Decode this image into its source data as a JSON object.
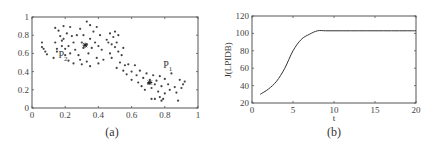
{
  "chart_data": [
    {
      "type": "scatter",
      "caption": "(a)",
      "title": "",
      "xlabel": "",
      "ylabel": "",
      "xlim": [
        0,
        1
      ],
      "ylim": [
        0,
        1
      ],
      "xticks": [
        "0",
        "0.2",
        "0.4",
        "0.6",
        "0.8",
        "1"
      ],
      "yticks": [
        "0",
        "0.2",
        "0.4",
        "0.6",
        "0.8",
        "1"
      ],
      "grid": false,
      "annotations": [
        {
          "text": "P2",
          "x": 0.16,
          "y": 0.55
        },
        {
          "text": "P1",
          "x": 0.79,
          "y": 0.44
        }
      ],
      "cluster_centers": [
        {
          "label": "P2",
          "x": 0.32,
          "y": 0.69
        },
        {
          "label": "P1",
          "x": 0.71,
          "y": 0.28
        }
      ],
      "points": [
        [
          0.06,
          0.72
        ],
        [
          0.06,
          0.67
        ],
        [
          0.07,
          0.65
        ],
        [
          0.08,
          0.62
        ],
        [
          0.09,
          0.59
        ],
        [
          0.13,
          0.55
        ],
        [
          0.14,
          0.88
        ],
        [
          0.14,
          0.72
        ],
        [
          0.15,
          0.65
        ],
        [
          0.15,
          0.62
        ],
        [
          0.16,
          0.85
        ],
        [
          0.17,
          0.79
        ],
        [
          0.18,
          0.74
        ],
        [
          0.18,
          0.68
        ],
        [
          0.19,
          0.9
        ],
        [
          0.19,
          0.76
        ],
        [
          0.2,
          0.65
        ],
        [
          0.2,
          0.58
        ],
        [
          0.21,
          0.82
        ],
        [
          0.22,
          0.68
        ],
        [
          0.22,
          0.52
        ],
        [
          0.23,
          0.89
        ],
        [
          0.23,
          0.6
        ],
        [
          0.24,
          0.79
        ],
        [
          0.25,
          0.72
        ],
        [
          0.25,
          0.49
        ],
        [
          0.26,
          0.64
        ],
        [
          0.27,
          0.8
        ],
        [
          0.28,
          0.58
        ],
        [
          0.29,
          0.87
        ],
        [
          0.29,
          0.53
        ],
        [
          0.3,
          0.72
        ],
        [
          0.3,
          0.48
        ],
        [
          0.31,
          0.66
        ],
        [
          0.31,
          0.8
        ],
        [
          0.32,
          0.69
        ],
        [
          0.33,
          0.95
        ],
        [
          0.33,
          0.7
        ],
        [
          0.33,
          0.51
        ],
        [
          0.34,
          0.6
        ],
        [
          0.35,
          0.91
        ],
        [
          0.35,
          0.76
        ],
        [
          0.35,
          0.46
        ],
        [
          0.36,
          0.66
        ],
        [
          0.37,
          0.84
        ],
        [
          0.38,
          0.72
        ],
        [
          0.39,
          0.89
        ],
        [
          0.39,
          0.55
        ],
        [
          0.4,
          0.68
        ],
        [
          0.4,
          0.49
        ],
        [
          0.41,
          0.8
        ],
        [
          0.42,
          0.64
        ],
        [
          0.43,
          0.53
        ],
        [
          0.45,
          0.75
        ],
        [
          0.46,
          0.72
        ],
        [
          0.47,
          0.82
        ],
        [
          0.47,
          0.6
        ],
        [
          0.48,
          0.7
        ],
        [
          0.48,
          0.55
        ],
        [
          0.49,
          0.78
        ],
        [
          0.5,
          0.67
        ],
        [
          0.5,
          0.84
        ],
        [
          0.51,
          0.44
        ],
        [
          0.51,
          0.72
        ],
        [
          0.52,
          0.62
        ],
        [
          0.52,
          0.8
        ],
        [
          0.53,
          0.5
        ],
        [
          0.54,
          0.58
        ],
        [
          0.55,
          0.41
        ],
        [
          0.55,
          0.66
        ],
        [
          0.56,
          0.47
        ],
        [
          0.57,
          0.37
        ],
        [
          0.58,
          0.48
        ],
        [
          0.6,
          0.4
        ],
        [
          0.6,
          0.31
        ],
        [
          0.62,
          0.47
        ],
        [
          0.63,
          0.36
        ],
        [
          0.64,
          0.28
        ],
        [
          0.65,
          0.41
        ],
        [
          0.66,
          0.24
        ],
        [
          0.67,
          0.33
        ],
        [
          0.68,
          0.2
        ],
        [
          0.69,
          0.38
        ],
        [
          0.7,
          0.27
        ],
        [
          0.71,
          0.28
        ],
        [
          0.71,
          0.31
        ],
        [
          0.72,
          0.22
        ],
        [
          0.72,
          0.1
        ],
        [
          0.73,
          0.36
        ],
        [
          0.74,
          0.26
        ],
        [
          0.74,
          0.1
        ],
        [
          0.75,
          0.3
        ],
        [
          0.76,
          0.18
        ],
        [
          0.77,
          0.35
        ],
        [
          0.77,
          0.12
        ],
        [
          0.78,
          0.24
        ],
        [
          0.78,
          0.08
        ],
        [
          0.79,
          0.1
        ],
        [
          0.8,
          0.16
        ],
        [
          0.8,
          0.32
        ],
        [
          0.82,
          0.26
        ],
        [
          0.83,
          0.2
        ],
        [
          0.84,
          0.38
        ],
        [
          0.86,
          0.23
        ],
        [
          0.87,
          0.17
        ],
        [
          0.88,
          0.08
        ],
        [
          0.89,
          0.31
        ],
        [
          0.9,
          0.22
        ],
        [
          0.91,
          0.26
        ],
        [
          0.92,
          0.29
        ]
      ]
    },
    {
      "type": "line",
      "caption": "(b)",
      "title": "",
      "xlabel": "t",
      "ylabel": "J(LPIDB)",
      "xlim": [
        0,
        20
      ],
      "ylim": [
        20,
        120
      ],
      "xticks": [
        "0",
        "5",
        "10",
        "15",
        "20"
      ],
      "yticks": [
        "20",
        "40",
        "60",
        "80",
        "100",
        "120"
      ],
      "grid": false,
      "series": [
        {
          "name": "J(LPIDB)",
          "x": [
            1,
            2,
            3,
            4,
            5,
            6,
            7,
            8,
            9,
            10,
            11,
            12,
            13,
            14,
            15,
            16,
            17,
            18,
            19,
            20
          ],
          "values": [
            30,
            36,
            45,
            60,
            80,
            93,
            99,
            103,
            103,
            103,
            103,
            103,
            103,
            103,
            103,
            103,
            103,
            103,
            103,
            103
          ]
        }
      ]
    }
  ]
}
